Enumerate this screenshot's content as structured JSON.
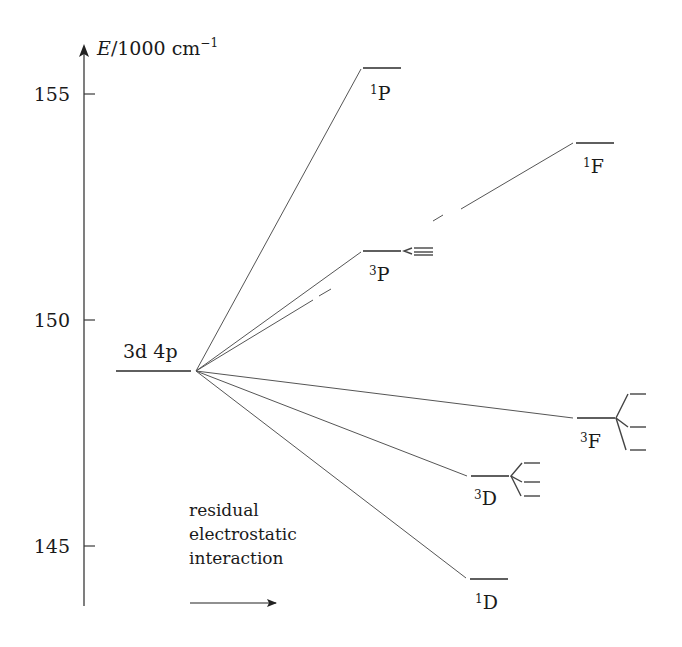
{
  "diagram": {
    "axis": {
      "label_var": "E",
      "label_unit": "/1000 cm",
      "label_exp": "−1",
      "ticks": [
        {
          "value": "155",
          "y": 94
        },
        {
          "value": "150",
          "y": 320
        },
        {
          "value": "145",
          "y": 546
        }
      ]
    },
    "configuration": {
      "label": "3d 4p",
      "energy": 148.8
    },
    "terms": [
      {
        "multiplicity": "1",
        "letter": "P",
        "energy": 155.3
      },
      {
        "multiplicity": "1",
        "letter": "F",
        "energy": 153.9
      },
      {
        "multiplicity": "3",
        "letter": "P",
        "energy": 151.6
      },
      {
        "multiplicity": "3",
        "letter": "F",
        "energy": 147.8
      },
      {
        "multiplicity": "3",
        "letter": "D",
        "energy": 146.6
      },
      {
        "multiplicity": "1",
        "letter": "D",
        "energy": 143.9
      }
    ],
    "annotation": {
      "line1": "residual",
      "line2": "electrostatic",
      "line3": "interaction"
    },
    "fine_structure_symbol": "<="
  }
}
